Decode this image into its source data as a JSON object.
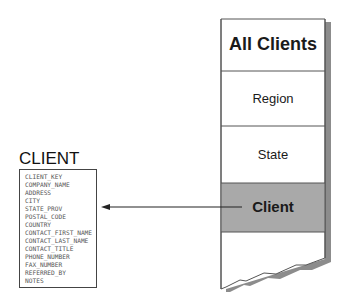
{
  "hierarchy": {
    "levels": [
      {
        "label": "All Clients",
        "style": "title"
      },
      {
        "label": "Region",
        "style": "normal"
      },
      {
        "label": "State",
        "style": "normal"
      },
      {
        "label": "Client",
        "style": "highlighted"
      }
    ],
    "highlight_color": "#a9a9a9",
    "shadow_color": "#8c8c8c"
  },
  "entity": {
    "title": "CLIENT",
    "fields": [
      "CLIENT_KEY",
      "COMPANY_NAME",
      "ADDRESS",
      "CITY",
      "STATE_PROV",
      "POSTAL_CODE",
      "COUNTRY",
      "CONTACT_FIRST_NAME",
      "CONTACT_LAST_NAME",
      "CONTACT_TITLE",
      "PHONE_NUMBER",
      "FAX_NUMBER",
      "REFERRED_BY",
      "NOTES"
    ]
  },
  "connector": {
    "from": "Client",
    "to": "CLIENT",
    "type": "arrow"
  }
}
